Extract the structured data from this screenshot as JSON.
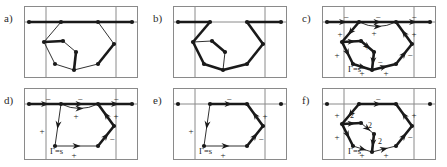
{
  "figure": {
    "width": 447,
    "height": 167,
    "background": "#ffffff",
    "stroke_dark": "#1a1a1a",
    "stroke_light": "#8a8a8a",
    "rows": 2,
    "cols": 3
  },
  "panels": [
    {
      "id": "a",
      "label": "a)",
      "row": 0,
      "col": 0,
      "x": 24,
      "y": 6,
      "w": 114,
      "h": 72,
      "has_arrows": false,
      "has_signs": false,
      "has_gamma": false,
      "gamma_label": "",
      "signs": [],
      "weights": [],
      "vertices": [
        {
          "name": "v-left-end",
          "x": 5,
          "y": 16,
          "dot": true
        },
        {
          "name": "v-top-left",
          "x": 37,
          "y": 16,
          "dot": true
        },
        {
          "name": "v-top-right",
          "x": 74,
          "y": 16,
          "dot": true
        },
        {
          "name": "v-right-end",
          "x": 108,
          "y": 16,
          "dot": true
        },
        {
          "name": "v-mid-left",
          "x": 20,
          "y": 36,
          "dot": true
        },
        {
          "name": "v-inner-left",
          "x": 39,
          "y": 35,
          "dot": true
        },
        {
          "name": "v-inner-mid",
          "x": 52,
          "y": 46,
          "dot": true
        },
        {
          "name": "v-bot-left",
          "x": 31,
          "y": 58,
          "dot": true
        },
        {
          "name": "v-bot-mid",
          "x": 50,
          "y": 64,
          "dot": true
        },
        {
          "name": "v-bot-right",
          "x": 74,
          "y": 58,
          "dot": true
        },
        {
          "name": "v-mid-right",
          "x": 90,
          "y": 38,
          "dot": true
        }
      ],
      "edges": [
        {
          "from": "v-left-end",
          "to": "v-top-left",
          "bold": true
        },
        {
          "from": "v-top-left",
          "to": "v-top-right",
          "bold": true
        },
        {
          "from": "v-top-right",
          "to": "v-right-end",
          "bold": true
        },
        {
          "from": "v-top-left",
          "to": "v-mid-left",
          "bold": false
        },
        {
          "from": "v-mid-left",
          "to": "v-inner-left",
          "bold": true
        },
        {
          "from": "v-inner-left",
          "to": "v-inner-mid",
          "bold": false
        },
        {
          "from": "v-mid-left",
          "to": "v-bot-left",
          "bold": false
        },
        {
          "from": "v-bot-left",
          "to": "v-bot-mid",
          "bold": false
        },
        {
          "from": "v-bot-mid",
          "to": "v-bot-right",
          "bold": false
        },
        {
          "from": "v-inner-mid",
          "to": "v-bot-mid",
          "bold": true
        },
        {
          "from": "v-bot-right",
          "to": "v-mid-right",
          "bold": true
        },
        {
          "from": "v-mid-right",
          "to": "v-top-right",
          "bold": false
        }
      ]
    },
    {
      "id": "b",
      "label": "b)",
      "row": 0,
      "col": 1,
      "x": 173,
      "y": 6,
      "w": 114,
      "h": 72,
      "has_arrows": false,
      "has_signs": false,
      "has_gamma": false,
      "gamma_label": "",
      "signs": [],
      "weights": [],
      "vertices": [
        {
          "name": "v-left-end",
          "x": 5,
          "y": 16,
          "dot": true
        },
        {
          "name": "v-top-left",
          "x": 37,
          "y": 16,
          "dot": true
        },
        {
          "name": "v-top-right",
          "x": 74,
          "y": 16,
          "dot": true
        },
        {
          "name": "v-right-end",
          "x": 108,
          "y": 16,
          "dot": true
        },
        {
          "name": "v-mid-left",
          "x": 20,
          "y": 36,
          "dot": true
        },
        {
          "name": "v-inner-left",
          "x": 39,
          "y": 35,
          "dot": true
        },
        {
          "name": "v-inner-mid",
          "x": 52,
          "y": 46,
          "dot": true
        },
        {
          "name": "v-bot-left",
          "x": 31,
          "y": 58,
          "dot": true
        },
        {
          "name": "v-bot-mid",
          "x": 50,
          "y": 64,
          "dot": true
        },
        {
          "name": "v-bot-right",
          "x": 74,
          "y": 58,
          "dot": true
        },
        {
          "name": "v-mid-right",
          "x": 90,
          "y": 38,
          "dot": true
        }
      ],
      "edges": [
        {
          "from": "v-left-end",
          "to": "v-top-left",
          "bold": true
        },
        {
          "from": "v-top-right",
          "to": "v-right-end",
          "bold": true
        },
        {
          "from": "v-top-left",
          "to": "v-mid-left",
          "bold": true
        },
        {
          "from": "v-mid-left",
          "to": "v-inner-left",
          "bold": false
        },
        {
          "from": "v-inner-left",
          "to": "v-inner-mid",
          "bold": true
        },
        {
          "from": "v-mid-left",
          "to": "v-bot-left",
          "bold": true
        },
        {
          "from": "v-bot-left",
          "to": "v-bot-mid",
          "bold": true
        },
        {
          "from": "v-bot-mid",
          "to": "v-bot-right",
          "bold": true
        },
        {
          "from": "v-inner-mid",
          "to": "v-bot-mid",
          "bold": false
        },
        {
          "from": "v-bot-right",
          "to": "v-mid-right",
          "bold": true
        },
        {
          "from": "v-mid-right",
          "to": "v-top-right",
          "bold": true
        }
      ]
    },
    {
      "id": "c",
      "label": "c)",
      "row": 0,
      "col": 2,
      "x": 322,
      "y": 6,
      "w": 114,
      "h": 72,
      "has_arrows": true,
      "has_signs": true,
      "has_gamma": true,
      "gamma_label": "Γ=s",
      "signs": [
        {
          "text": "−",
          "x": 24,
          "y": 12
        },
        {
          "text": "−",
          "x": 56,
          "y": 12
        },
        {
          "text": "−",
          "x": 92,
          "y": 12
        },
        {
          "text": "+",
          "x": 18,
          "y": 29
        },
        {
          "text": "+",
          "x": 52,
          "y": 28
        },
        {
          "text": "+",
          "x": 92,
          "y": 29
        },
        {
          "text": "+",
          "x": 45,
          "y": 42
        },
        {
          "text": "+",
          "x": 15,
          "y": 50
        },
        {
          "text": "−",
          "x": 88,
          "y": 50
        },
        {
          "text": "−",
          "x": 58,
          "y": 57
        },
        {
          "text": "+",
          "x": 40,
          "y": 68
        },
        {
          "text": "+",
          "x": 64,
          "y": 68
        }
      ],
      "weights": [],
      "vertices": [
        {
          "name": "v-left-end",
          "x": 5,
          "y": 16,
          "dot": true
        },
        {
          "name": "v-top-left",
          "x": 37,
          "y": 16,
          "dot": true
        },
        {
          "name": "v-top-right",
          "x": 74,
          "y": 16,
          "dot": true
        },
        {
          "name": "v-right-end",
          "x": 108,
          "y": 16,
          "dot": true
        },
        {
          "name": "v-mid-left",
          "x": 20,
          "y": 36,
          "dot": true
        },
        {
          "name": "v-inner-left",
          "x": 39,
          "y": 35,
          "dot": true
        },
        {
          "name": "v-inner-mid",
          "x": 52,
          "y": 46,
          "dot": true
        },
        {
          "name": "v-bot-left",
          "x": 31,
          "y": 58,
          "dot": true
        },
        {
          "name": "v-bot-mid",
          "x": 50,
          "y": 64,
          "dot": true
        },
        {
          "name": "v-bot-right",
          "x": 74,
          "y": 58,
          "dot": true
        },
        {
          "name": "v-mid-right",
          "x": 90,
          "y": 38,
          "dot": true
        }
      ],
      "edges": [
        {
          "from": "v-left-end",
          "to": "v-top-left",
          "bold": true,
          "arrow": true
        },
        {
          "from": "v-top-left",
          "to": "v-top-right",
          "bold": true,
          "arrow": true
        },
        {
          "from": "v-top-right",
          "to": "v-right-end",
          "bold": true,
          "arrow": true
        },
        {
          "from": "v-top-left",
          "to": "v-mid-left",
          "bold": true,
          "arrow": true
        },
        {
          "from": "v-mid-left",
          "to": "v-inner-left",
          "bold": true,
          "arrow": true
        },
        {
          "from": "v-inner-left",
          "to": "v-inner-mid",
          "bold": true,
          "arrow": true
        },
        {
          "from": "v-mid-left",
          "to": "v-bot-left",
          "bold": true,
          "arrow": true
        },
        {
          "from": "v-bot-left",
          "to": "v-bot-mid",
          "bold": true,
          "arrow": true
        },
        {
          "from": "v-bot-mid",
          "to": "v-bot-right",
          "bold": true,
          "arrow": true
        },
        {
          "from": "v-inner-mid",
          "to": "v-bot-mid",
          "bold": true,
          "arrow": true
        },
        {
          "from": "v-bot-right",
          "to": "v-mid-right",
          "bold": true,
          "arrow": true
        },
        {
          "from": "v-mid-right",
          "to": "v-top-right",
          "bold": true,
          "arrow": true
        }
      ],
      "curves": [
        {
          "from": "v-top-left",
          "to": "v-top-right",
          "sag": 9,
          "arrow": true
        }
      ]
    },
    {
      "id": "d",
      "label": "d)",
      "row": 1,
      "col": 0,
      "x": 24,
      "y": 88,
      "w": 114,
      "h": 72,
      "has_arrows": true,
      "has_signs": true,
      "has_gamma": true,
      "gamma_label": "Γ=s",
      "signs": [
        {
          "text": "−",
          "x": 24,
          "y": 12
        },
        {
          "text": "−",
          "x": 56,
          "y": 12
        },
        {
          "text": "−",
          "x": 92,
          "y": 12
        },
        {
          "text": "+",
          "x": 52,
          "y": 29
        },
        {
          "text": "+",
          "x": 92,
          "y": 29
        },
        {
          "text": "+",
          "x": 18,
          "y": 44
        },
        {
          "text": "−",
          "x": 88,
          "y": 52
        },
        {
          "text": "+",
          "x": 50,
          "y": 68
        }
      ],
      "weights": [],
      "vertices": [
        {
          "name": "v-left-end",
          "x": 5,
          "y": 16,
          "dot": true
        },
        {
          "name": "v-top-left",
          "x": 37,
          "y": 16,
          "dot": true
        },
        {
          "name": "v-top-right",
          "x": 74,
          "y": 16,
          "dot": true
        },
        {
          "name": "v-right-end",
          "x": 108,
          "y": 16,
          "dot": true
        },
        {
          "name": "v-bot-left",
          "x": 31,
          "y": 58,
          "dot": true
        },
        {
          "name": "v-bot-right",
          "x": 74,
          "y": 58,
          "dot": true
        },
        {
          "name": "v-mid-right",
          "x": 90,
          "y": 38,
          "dot": true
        }
      ],
      "edges": [
        {
          "from": "v-left-end",
          "to": "v-top-left",
          "bold": true,
          "arrow": true
        },
        {
          "from": "v-top-left",
          "to": "v-top-right",
          "bold": true,
          "arrow": true
        },
        {
          "from": "v-top-right",
          "to": "v-right-end",
          "bold": true,
          "arrow": true
        },
        {
          "from": "v-top-left",
          "to": "v-bot-left",
          "bold": false,
          "arrow": true
        },
        {
          "from": "v-bot-left",
          "to": "v-bot-right",
          "bold": false,
          "arrow": true
        },
        {
          "from": "v-bot-right",
          "to": "v-mid-right",
          "bold": true,
          "arrow": true
        },
        {
          "from": "v-mid-right",
          "to": "v-top-right",
          "bold": true,
          "arrow": true
        }
      ],
      "curves": [
        {
          "from": "v-top-left",
          "to": "v-top-right",
          "sag": 9,
          "arrow": true
        }
      ]
    },
    {
      "id": "e",
      "label": "e)",
      "row": 1,
      "col": 1,
      "x": 173,
      "y": 88,
      "w": 114,
      "h": 72,
      "has_arrows": true,
      "has_signs": true,
      "has_gamma": true,
      "gamma_label": "Γ=s",
      "signs": [
        {
          "text": "−",
          "x": 56,
          "y": 12
        },
        {
          "text": "+",
          "x": 92,
          "y": 29
        },
        {
          "text": "+",
          "x": 18,
          "y": 44
        },
        {
          "text": "−",
          "x": 88,
          "y": 52
        },
        {
          "text": "+",
          "x": 50,
          "y": 68
        }
      ],
      "weights": [],
      "vertices": [
        {
          "name": "v-left-end",
          "x": 5,
          "y": 16,
          "dot": true
        },
        {
          "name": "v-top-left",
          "x": 37,
          "y": 16,
          "dot": true
        },
        {
          "name": "v-top-right",
          "x": 74,
          "y": 16,
          "dot": true
        },
        {
          "name": "v-right-end",
          "x": 108,
          "y": 16,
          "dot": true
        },
        {
          "name": "v-bot-left",
          "x": 31,
          "y": 58,
          "dot": true
        },
        {
          "name": "v-bot-right",
          "x": 74,
          "y": 58,
          "dot": true
        },
        {
          "name": "v-mid-right",
          "x": 90,
          "y": 38,
          "dot": true
        }
      ],
      "edges": [
        {
          "from": "v-top-left",
          "to": "v-top-right",
          "bold": true,
          "arrow": true
        },
        {
          "from": "v-top-left",
          "to": "v-bot-left",
          "bold": false,
          "arrow": true
        },
        {
          "from": "v-bot-left",
          "to": "v-bot-right",
          "bold": false,
          "arrow": true
        },
        {
          "from": "v-bot-right",
          "to": "v-mid-right",
          "bold": true,
          "arrow": true
        },
        {
          "from": "v-mid-right",
          "to": "v-top-right",
          "bold": true,
          "arrow": true
        }
      ],
      "curves": []
    },
    {
      "id": "f",
      "label": "f)",
      "row": 1,
      "col": 2,
      "x": 322,
      "y": 88,
      "w": 114,
      "h": 72,
      "has_arrows": true,
      "has_signs": true,
      "has_gamma": true,
      "gamma_label": "Γ=s",
      "signs": [
        {
          "text": "−",
          "x": 56,
          "y": 12
        },
        {
          "text": "+",
          "x": 15,
          "y": 28
        },
        {
          "text": "+",
          "x": 92,
          "y": 28
        },
        {
          "text": "+",
          "x": 15,
          "y": 50
        },
        {
          "text": "−",
          "x": 88,
          "y": 50
        },
        {
          "text": "+",
          "x": 40,
          "y": 68
        },
        {
          "text": "+",
          "x": 64,
          "y": 68
        }
      ],
      "weights": [
        {
          "text": "2",
          "x": 30,
          "y": 28
        },
        {
          "text": "2",
          "x": 48,
          "y": 38
        },
        {
          "text": "2",
          "x": 58,
          "y": 54
        }
      ],
      "vertices": [
        {
          "name": "v-left-end",
          "x": 5,
          "y": 16,
          "dot": true
        },
        {
          "name": "v-top-left",
          "x": 37,
          "y": 16,
          "dot": true
        },
        {
          "name": "v-top-right",
          "x": 74,
          "y": 16,
          "dot": true
        },
        {
          "name": "v-right-end",
          "x": 108,
          "y": 16,
          "dot": true
        },
        {
          "name": "v-mid-left",
          "x": 20,
          "y": 36,
          "dot": true
        },
        {
          "name": "v-inner-left",
          "x": 39,
          "y": 35,
          "dot": true
        },
        {
          "name": "v-inner-mid",
          "x": 52,
          "y": 46,
          "dot": true
        },
        {
          "name": "v-bot-left",
          "x": 31,
          "y": 58,
          "dot": true
        },
        {
          "name": "v-bot-mid",
          "x": 50,
          "y": 64,
          "dot": true
        },
        {
          "name": "v-bot-right",
          "x": 74,
          "y": 58,
          "dot": true
        },
        {
          "name": "v-mid-right",
          "x": 90,
          "y": 38,
          "dot": true
        }
      ],
      "edges": [
        {
          "from": "v-top-left",
          "to": "v-top-right",
          "bold": true,
          "arrow": true
        },
        {
          "from": "v-top-left",
          "to": "v-mid-left",
          "bold": true,
          "arrow": true
        },
        {
          "from": "v-mid-left",
          "to": "v-inner-left",
          "bold": true,
          "arrow": true
        },
        {
          "from": "v-inner-left",
          "to": "v-inner-mid",
          "bold": false,
          "arrow": true
        },
        {
          "from": "v-mid-left",
          "to": "v-bot-left",
          "bold": true,
          "arrow": true
        },
        {
          "from": "v-bot-left",
          "to": "v-bot-mid",
          "bold": false,
          "arrow": true
        },
        {
          "from": "v-bot-mid",
          "to": "v-bot-right",
          "bold": false,
          "arrow": true
        },
        {
          "from": "v-inner-mid",
          "to": "v-bot-mid",
          "bold": true,
          "arrow": true
        },
        {
          "from": "v-bot-right",
          "to": "v-mid-right",
          "bold": true,
          "arrow": true
        },
        {
          "from": "v-mid-right",
          "to": "v-top-right",
          "bold": true,
          "arrow": true
        }
      ],
      "curves": []
    }
  ],
  "panel_frame": {
    "band_left_x": 22,
    "band_right_x": 92,
    "top_line_y": 16,
    "name": "three-band-frame"
  }
}
